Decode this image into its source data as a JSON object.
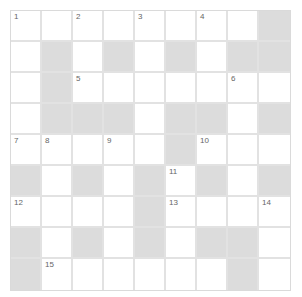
{
  "puzzle": {
    "type": "crossword",
    "rows": 9,
    "cols": 9,
    "colors": {
      "white_cell": "#ffffff",
      "black_cell": "#dcdcdc",
      "grid_line": "#e2e2e2",
      "number": "#666666"
    },
    "layout": [
      "WWWWWWWWB",
      "WBWBWBWBB",
      "WBWWWWWWW",
      "WBBBWBBWB",
      "WWWWWBWWW",
      "BWBWBWBWB",
      "WWWWBWWWW",
      "BWBWBWBBW",
      "BWWWWWWBW"
    ],
    "numbers": [
      {
        "r": 0,
        "c": 0,
        "n": "1"
      },
      {
        "r": 0,
        "c": 2,
        "n": "2"
      },
      {
        "r": 0,
        "c": 4,
        "n": "3"
      },
      {
        "r": 0,
        "c": 6,
        "n": "4"
      },
      {
        "r": 2,
        "c": 2,
        "n": "5"
      },
      {
        "r": 2,
        "c": 7,
        "n": "6"
      },
      {
        "r": 4,
        "c": 0,
        "n": "7"
      },
      {
        "r": 4,
        "c": 1,
        "n": "8"
      },
      {
        "r": 4,
        "c": 3,
        "n": "9"
      },
      {
        "r": 4,
        "c": 6,
        "n": "10"
      },
      {
        "r": 5,
        "c": 5,
        "n": "11"
      },
      {
        "r": 6,
        "c": 0,
        "n": "12"
      },
      {
        "r": 6,
        "c": 5,
        "n": "13"
      },
      {
        "r": 6,
        "c": 8,
        "n": "14"
      },
      {
        "r": 8,
        "c": 1,
        "n": "15"
      }
    ]
  }
}
